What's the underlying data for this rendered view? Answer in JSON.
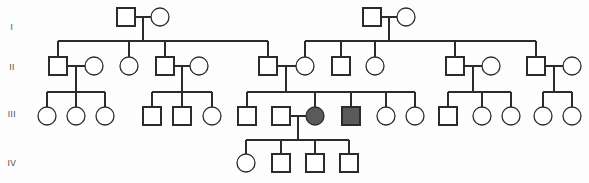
{
  "chart_title": "Four-generation pedigree chart",
  "legend": {
    "square_meaning": "male",
    "circle_meaning": "female",
    "filled_meaning": "affected individual",
    "unfilled_meaning": "unaffected individual"
  },
  "colors": {
    "stroke": "#2b2b2b",
    "unaffected_fill": "#ffffff",
    "affected_fill": "#5a5a5c",
    "background": "#fdfdfd",
    "label_color": "#4a4a4a"
  },
  "geometry": {
    "width": 589,
    "height": 183,
    "symbol_size": 18,
    "stroke_width": 1.3
  },
  "generations": [
    {
      "label": "I",
      "label_x": 12,
      "label_y": 30,
      "row_y": 17
    },
    {
      "label": "II",
      "label_x": 12,
      "label_y": 70,
      "row_y": 66
    },
    {
      "label": "III",
      "label_x": 12,
      "label_y": 117,
      "row_y": 116
    },
    {
      "label": "IV",
      "label_x": 12,
      "label_y": 166,
      "row_y": 163
    }
  ],
  "chart_data": {
    "type": "diagram",
    "generation_count": 4,
    "individual_count": 53,
    "affected_count": 2,
    "individuals": [
      {
        "id": "I-1",
        "gen": 1,
        "sex": "male",
        "affected": false,
        "cx": 126,
        "cy": 17
      },
      {
        "id": "I-2",
        "gen": 1,
        "sex": "female",
        "affected": false,
        "cx": 160,
        "cy": 17
      },
      {
        "id": "I-3",
        "gen": 1,
        "sex": "male",
        "affected": false,
        "cx": 372,
        "cy": 17
      },
      {
        "id": "I-4",
        "gen": 1,
        "sex": "female",
        "affected": false,
        "cx": 406,
        "cy": 17
      },
      {
        "id": "II-1",
        "gen": 2,
        "sex": "male",
        "affected": false,
        "cx": 58,
        "cy": 66
      },
      {
        "id": "II-2",
        "gen": 2,
        "sex": "female",
        "affected": false,
        "cx": 94,
        "cy": 66
      },
      {
        "id": "II-3",
        "gen": 2,
        "sex": "female",
        "affected": false,
        "cx": 129,
        "cy": 66
      },
      {
        "id": "II-4",
        "gen": 2,
        "sex": "male",
        "affected": false,
        "cx": 165,
        "cy": 66
      },
      {
        "id": "II-5",
        "gen": 2,
        "sex": "female",
        "affected": false,
        "cx": 199,
        "cy": 66
      },
      {
        "id": "II-6",
        "gen": 2,
        "sex": "male",
        "affected": false,
        "cx": 268,
        "cy": 66
      },
      {
        "id": "II-7",
        "gen": 2,
        "sex": "female",
        "affected": false,
        "cx": 305,
        "cy": 66
      },
      {
        "id": "II-8",
        "gen": 2,
        "sex": "male",
        "affected": false,
        "cx": 341,
        "cy": 66
      },
      {
        "id": "II-9",
        "gen": 2,
        "sex": "female",
        "affected": false,
        "cx": 375,
        "cy": 66
      },
      {
        "id": "II-10",
        "gen": 2,
        "sex": "male",
        "affected": false,
        "cx": 455,
        "cy": 66
      },
      {
        "id": "II-11",
        "gen": 2,
        "sex": "female",
        "affected": false,
        "cx": 491,
        "cy": 66
      },
      {
        "id": "II-12",
        "gen": 2,
        "sex": "male",
        "affected": false,
        "cx": 536,
        "cy": 66
      },
      {
        "id": "II-13",
        "gen": 2,
        "sex": "female",
        "affected": false,
        "cx": 572,
        "cy": 66
      },
      {
        "id": "III-1",
        "gen": 3,
        "sex": "female",
        "affected": false,
        "cx": 47,
        "cy": 116
      },
      {
        "id": "III-2",
        "gen": 3,
        "sex": "female",
        "affected": false,
        "cx": 76,
        "cy": 116
      },
      {
        "id": "III-3",
        "gen": 3,
        "sex": "female",
        "affected": false,
        "cx": 105,
        "cy": 116
      },
      {
        "id": "III-4",
        "gen": 3,
        "sex": "male",
        "affected": false,
        "cx": 152,
        "cy": 116
      },
      {
        "id": "III-5",
        "gen": 3,
        "sex": "male",
        "affected": false,
        "cx": 182,
        "cy": 116
      },
      {
        "id": "III-6",
        "gen": 3,
        "sex": "female",
        "affected": false,
        "cx": 212,
        "cy": 116
      },
      {
        "id": "III-7",
        "gen": 3,
        "sex": "male",
        "affected": false,
        "cx": 247,
        "cy": 116
      },
      {
        "id": "III-8",
        "gen": 3,
        "sex": "male",
        "affected": false,
        "cx": 281,
        "cy": 116
      },
      {
        "id": "III-9",
        "gen": 3,
        "sex": "female",
        "affected": true,
        "cx": 315,
        "cy": 116
      },
      {
        "id": "III-10",
        "gen": 3,
        "sex": "male",
        "affected": true,
        "cx": 351,
        "cy": 116
      },
      {
        "id": "III-11",
        "gen": 3,
        "sex": "female",
        "affected": false,
        "cx": 386,
        "cy": 116
      },
      {
        "id": "III-12",
        "gen": 3,
        "sex": "female",
        "affected": false,
        "cx": 415,
        "cy": 116
      },
      {
        "id": "III-13",
        "gen": 3,
        "sex": "male",
        "affected": false,
        "cx": 448,
        "cy": 116
      },
      {
        "id": "III-14",
        "gen": 3,
        "sex": "female",
        "affected": false,
        "cx": 482,
        "cy": 116
      },
      {
        "id": "III-15",
        "gen": 3,
        "sex": "female",
        "affected": false,
        "cx": 511,
        "cy": 116
      },
      {
        "id": "III-16",
        "gen": 3,
        "sex": "female",
        "affected": false,
        "cx": 543,
        "cy": 116
      },
      {
        "id": "III-17",
        "gen": 3,
        "sex": "female",
        "affected": false,
        "cx": 572,
        "cy": 116
      },
      {
        "id": "IV-1",
        "gen": 4,
        "sex": "female",
        "affected": false,
        "cx": 246,
        "cy": 163
      },
      {
        "id": "IV-2",
        "gen": 4,
        "sex": "male",
        "affected": false,
        "cx": 281,
        "cy": 163
      },
      {
        "id": "IV-3",
        "gen": 4,
        "sex": "male",
        "affected": false,
        "cx": 315,
        "cy": 163
      },
      {
        "id": "IV-4",
        "gen": 4,
        "sex": "male",
        "affected": false,
        "cx": 349,
        "cy": 163
      }
    ],
    "matings": [
      {
        "id": "M1",
        "partners": [
          "I-1",
          "I-2"
        ],
        "union_x": 143,
        "union_y": 17,
        "drop_to": 41
      },
      {
        "id": "M2",
        "partners": [
          "I-3",
          "I-4"
        ],
        "union_x": 389,
        "union_y": 17,
        "drop_to": 41
      },
      {
        "id": "M3",
        "partners": [
          "II-1",
          "II-2"
        ],
        "union_x": 76,
        "union_y": 66,
        "drop_to": 92
      },
      {
        "id": "M4",
        "partners": [
          "II-4",
          "II-5"
        ],
        "union_x": 182,
        "union_y": 66,
        "drop_to": 92
      },
      {
        "id": "M5",
        "partners": [
          "II-6",
          "II-7"
        ],
        "union_x": 286,
        "union_y": 66,
        "drop_to": 92
      },
      {
        "id": "M6",
        "partners": [
          "II-10",
          "II-11"
        ],
        "union_x": 473,
        "union_y": 66,
        "drop_to": 92
      },
      {
        "id": "M7",
        "partners": [
          "II-12",
          "II-13"
        ],
        "union_x": 554,
        "union_y": 66,
        "drop_to": 92
      },
      {
        "id": "M8",
        "partners": [
          "III-8",
          "III-9"
        ],
        "union_x": 298,
        "union_y": 116,
        "drop_to": 140
      }
    ],
    "sibships": [
      {
        "parents": "M1",
        "sib_line_y": 41,
        "children": [
          "II-1",
          "II-3",
          "II-4",
          "II-6"
        ]
      },
      {
        "parents": "M2",
        "sib_line_y": 41,
        "children": [
          "II-7",
          "II-8",
          "II-9",
          "II-10",
          "II-12"
        ]
      },
      {
        "parents": "M3",
        "sib_line_y": 92,
        "children": [
          "III-1",
          "III-2",
          "III-3"
        ]
      },
      {
        "parents": "M4",
        "sib_line_y": 92,
        "children": [
          "III-4",
          "III-5",
          "III-6"
        ]
      },
      {
        "parents": "M5",
        "sib_line_y": 92,
        "children": [
          "III-7",
          "III-9",
          "III-10",
          "III-11",
          "III-12"
        ]
      },
      {
        "parents": "M6",
        "sib_line_y": 92,
        "children": [
          "III-13",
          "III-14",
          "III-15"
        ]
      },
      {
        "parents": "M7",
        "sib_line_y": 92,
        "children": [
          "III-16",
          "III-17"
        ]
      },
      {
        "parents": "M8",
        "sib_line_y": 140,
        "children": [
          "IV-1",
          "IV-2",
          "IV-3",
          "IV-4"
        ]
      }
    ]
  }
}
